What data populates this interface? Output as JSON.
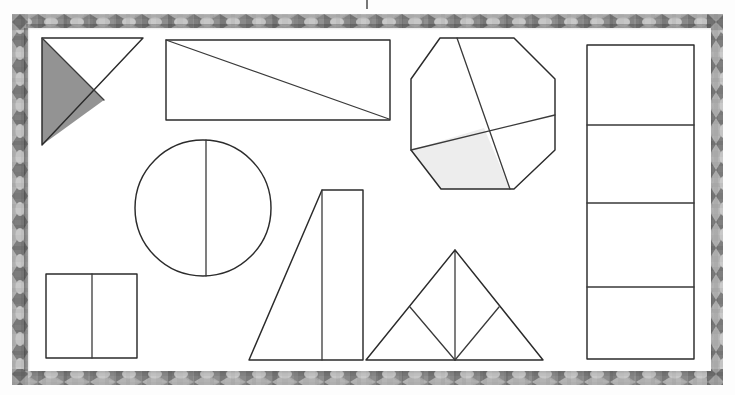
{
  "document": {
    "kind": "scanned-worksheet-photo",
    "media": "white paper inside a patterned decorative border frame",
    "page_background_color": "#ffffff",
    "ink_color": "#2b2b2b",
    "frame": {
      "name": "patterned-border-frame",
      "motif": "alternating diamond and bowtie blocks",
      "colors": [
        "#6f6f6f",
        "#8e8e8e",
        "#b9b9b9",
        "#c6c6c6"
      ],
      "thickness_px": 16
    },
    "artifacts": [
      {
        "name": "top-edge-mark",
        "description": "small dark vertical mark cropped at the top edge"
      }
    ]
  },
  "shapes": [
    {
      "id": "shaded-right-triangle",
      "label": "Right triangle split into two halves, left half shaded",
      "type": "triangle",
      "parts": 2,
      "shaded_parts": 1,
      "shading": "heavy pencil hatching",
      "shading_color": "#7b7b7b",
      "position": "top-left"
    },
    {
      "id": "rectangle-diagonal",
      "label": "Wide rectangle divided by one diagonal",
      "type": "rectangle",
      "parts": 2,
      "shaded_parts": 0,
      "divider": "diagonal from top-left to bottom-right",
      "position": "top-center"
    },
    {
      "id": "octagon-quarters",
      "label": "Octagon divided into four parts, one part lightly shaded",
      "type": "octagon",
      "parts": 4,
      "shaded_parts": 1,
      "shading": "light pencil shading",
      "shading_color": "#ededed",
      "position": "top-right"
    },
    {
      "id": "rectangle-four-bands",
      "label": "Tall rectangle divided into four horizontal bands",
      "type": "rectangle",
      "parts": 4,
      "shaded_parts": 0,
      "divider": "three horizontal lines",
      "position": "right-column"
    },
    {
      "id": "circle-halves",
      "label": "Circle divided by a vertical line into two parts",
      "type": "circle",
      "parts": 2,
      "shaded_parts": 0,
      "divider": "vertical chord near the centre",
      "position": "middle-left"
    },
    {
      "id": "quadrilateral-split",
      "label": "Slanted quadrilateral divided by a vertical line",
      "type": "quadrilateral",
      "parts": 2,
      "shaded_parts": 0,
      "divider": "vertical line",
      "position": "middle-center"
    },
    {
      "id": "triangle-four-parts",
      "label": "Large triangle divided into four smaller triangles",
      "type": "triangle",
      "parts": 4,
      "shaded_parts": 0,
      "divider": "midsegments plus a vertical median",
      "position": "bottom-center"
    },
    {
      "id": "square-halves",
      "label": "Square divided into two vertical halves",
      "type": "square",
      "parts": 2,
      "shaded_parts": 0,
      "divider": "one vertical line",
      "position": "bottom-left"
    }
  ]
}
